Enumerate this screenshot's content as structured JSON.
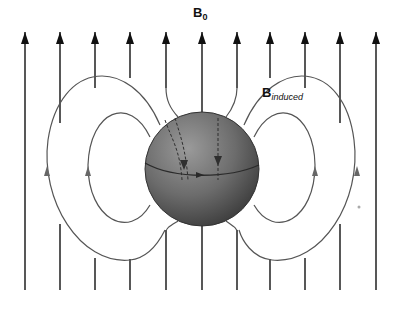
{
  "diagram": {
    "labels": {
      "external_field_main": "B",
      "external_field_sub": "0",
      "induced_field_main": "B",
      "induced_field_sub": "induced"
    },
    "external_field_lines": {
      "count": 11,
      "direction": "up",
      "x_positions": [
        25,
        60,
        95,
        130,
        166,
        202,
        237,
        270,
        305,
        340,
        376
      ],
      "color": "#111111"
    },
    "induced_loops": {
      "left": {
        "outer_arrow": "up",
        "inner_arrow": "up"
      },
      "right": {
        "outer_arrow": "up",
        "inner_arrow": "up"
      },
      "color": "#555555"
    },
    "sphere": {
      "center": [
        202,
        169
      ],
      "radius": 57,
      "fill_light": "#8a8a8a",
      "fill_dark": "#3e3e3e",
      "equator_arrow": "right",
      "internal_dashed_arrows": "down"
    }
  }
}
